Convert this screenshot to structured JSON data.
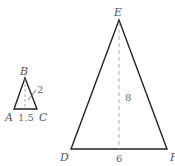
{
  "small_triangle": {
    "vertices": {
      "top": "B",
      "left": "A",
      "right": "C"
    },
    "base_label": "1.5",
    "height_label": "2"
  },
  "large_triangle": {
    "vertices": {
      "top": "E",
      "left": "D",
      "right": "F"
    },
    "base_label": "6",
    "height_label": "8"
  },
  "colors": {
    "stroke": "#222222",
    "dashed": "#999999",
    "text": "#555555"
  }
}
